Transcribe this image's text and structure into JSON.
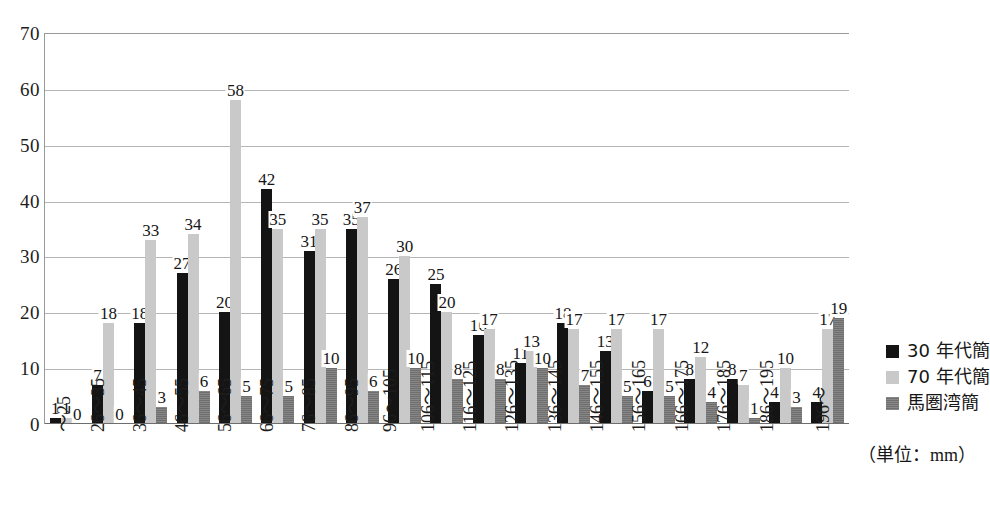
{
  "chart_data": {
    "type": "bar",
    "title": "",
    "xlabel": "",
    "ylabel": "",
    "unit_note": "（単位：mm）",
    "ylim": [
      0,
      70
    ],
    "y_ticks": [
      0,
      10,
      20,
      30,
      40,
      50,
      60,
      70
    ],
    "grid": true,
    "legend_position": "right",
    "categories": [
      "～25",
      "26～35",
      "36～45",
      "46～55",
      "56～65",
      "66～75",
      "76～85",
      "86～95",
      "96～105",
      "106～115",
      "116～125",
      "126～135",
      "136～145",
      "146～155",
      "156～165",
      "166～175",
      "176～185",
      "186～195",
      "196～"
    ],
    "series": [
      {
        "name": "30 年代簡",
        "color": "#141414",
        "values": [
          1,
          7,
          18,
          27,
          20,
          42,
          31,
          35,
          26,
          25,
          16,
          11,
          18,
          13,
          6,
          8,
          8,
          4,
          4
        ]
      },
      {
        "name": "70 年代簡",
        "color": "#c9c9c9",
        "values": [
          1,
          18,
          33,
          34,
          58,
          35,
          35,
          37,
          30,
          20,
          17,
          13,
          17,
          17,
          17,
          12,
          7,
          10,
          17
        ]
      },
      {
        "name": "馬圏湾簡",
        "color": "#6f6f6f",
        "values": [
          0,
          0,
          3,
          6,
          5,
          5,
          10,
          6,
          10,
          8,
          8,
          10,
          7,
          5,
          5,
          4,
          1,
          3,
          19
        ]
      }
    ]
  }
}
